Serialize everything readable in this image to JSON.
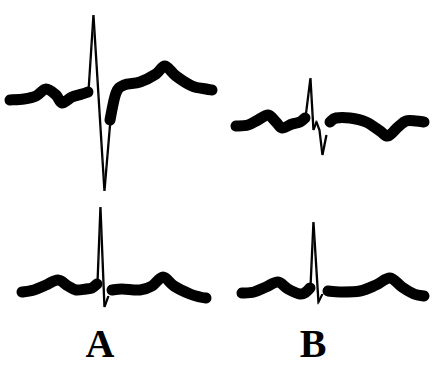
{
  "figure": {
    "width": 444,
    "height": 387,
    "background_color": "#ffffff",
    "ink_color": "#000000"
  },
  "labels": {
    "a": "A",
    "b": "B"
  },
  "chart_data": {
    "type": "line",
    "title": "",
    "xlabel": "",
    "ylabel": "",
    "grid": false,
    "legend": "none",
    "axis_visible": false,
    "stroke_color": "#000000",
    "panels": [
      {
        "id": "A-top",
        "label": "A",
        "row": "top",
        "column": "left",
        "baseline_y": 98,
        "x_range": [
          10,
          212
        ],
        "thick_stroke_width": 11,
        "thin_stroke_width": 1.4,
        "features": {
          "p_wave_peak": {
            "x": 46,
            "y": 88
          },
          "q_notch": {
            "x": 62,
            "y": 103
          },
          "r_peak": {
            "x": 93,
            "y": 15
          },
          "s_trough": {
            "x": 104,
            "y": 191
          },
          "st_segment_y": 82,
          "t_wave_peak": {
            "x": 165,
            "y": 66
          }
        },
        "points": [
          [
            10,
            100
          ],
          [
            24,
            99
          ],
          [
            36,
            96
          ],
          [
            46,
            89
          ],
          [
            56,
            95
          ],
          [
            62,
            103
          ],
          [
            72,
            97
          ],
          [
            82,
            94
          ],
          [
            88,
            92
          ],
          [
            93,
            15
          ],
          [
            104,
            191
          ],
          [
            110,
            120
          ],
          [
            116,
            93
          ],
          [
            124,
            85
          ],
          [
            140,
            82
          ],
          [
            156,
            74
          ],
          [
            165,
            66
          ],
          [
            176,
            76
          ],
          [
            192,
            86
          ],
          [
            206,
            89
          ],
          [
            212,
            90
          ]
        ]
      },
      {
        "id": "A-bottom",
        "label": "A",
        "row": "bottom",
        "column": "left",
        "baseline_y": 287,
        "x_range": [
          22,
          206
        ],
        "thick_stroke_width": 11,
        "thin_stroke_width": 1.4,
        "features": {
          "p_wave_peak": {
            "x": 58,
            "y": 279
          },
          "q_notch": {
            "x": 76,
            "y": 290
          },
          "r_peak": {
            "x": 100,
            "y": 207
          },
          "s_trough": {
            "x": 104,
            "y": 307
          },
          "st_segment_y": 288,
          "t_wave_peak": {
            "x": 163,
            "y": 277
          }
        },
        "points": [
          [
            22,
            292
          ],
          [
            34,
            290
          ],
          [
            46,
            285
          ],
          [
            58,
            280
          ],
          [
            68,
            286
          ],
          [
            76,
            290
          ],
          [
            86,
            289
          ],
          [
            92,
            288
          ],
          [
            97,
            284
          ],
          [
            100,
            207
          ],
          [
            104,
            307
          ],
          [
            108,
            296
          ],
          [
            112,
            290
          ],
          [
            122,
            289
          ],
          [
            140,
            290
          ],
          [
            152,
            286
          ],
          [
            163,
            277
          ],
          [
            174,
            286
          ],
          [
            190,
            294
          ],
          [
            200,
            297
          ],
          [
            206,
            298
          ]
        ]
      },
      {
        "id": "B-top",
        "label": "B",
        "row": "top",
        "column": "right",
        "baseline_y": 122,
        "x_range": [
          236,
          424
        ],
        "thick_stroke_width": 11,
        "thin_stroke_width": 1.4,
        "features": {
          "p_wave_peak": {
            "x": 268,
            "y": 114
          },
          "q_notch": {
            "x": 282,
            "y": 128
          },
          "r_peak": {
            "x": 310,
            "y": 78
          },
          "r_prime_notch": {
            "x": 314,
            "y": 132
          },
          "s_trough": {
            "x": 322,
            "y": 155
          },
          "st_segment_y": 118,
          "t_wave_trough": {
            "x": 388,
            "y": 136
          },
          "t_wave_peak": {
            "x": 404,
            "y": 122
          }
        },
        "points": [
          [
            236,
            126
          ],
          [
            248,
            125
          ],
          [
            258,
            120
          ],
          [
            268,
            115
          ],
          [
            276,
            122
          ],
          [
            282,
            128
          ],
          [
            292,
            124
          ],
          [
            300,
            122
          ],
          [
            305,
            118
          ],
          [
            310,
            78
          ],
          [
            313,
            130
          ],
          [
            316,
            122
          ],
          [
            319,
            130
          ],
          [
            322,
            155
          ],
          [
            326,
            135
          ],
          [
            330,
            122
          ],
          [
            336,
            118
          ],
          [
            350,
            118
          ],
          [
            366,
            122
          ],
          [
            380,
            131
          ],
          [
            388,
            136
          ],
          [
            398,
            127
          ],
          [
            406,
            121
          ],
          [
            416,
            121
          ],
          [
            424,
            122
          ]
        ]
      },
      {
        "id": "B-bottom",
        "label": "B",
        "row": "bottom",
        "column": "right",
        "baseline_y": 290,
        "x_range": [
          242,
          424
        ],
        "thick_stroke_width": 11,
        "thin_stroke_width": 1.4,
        "features": {
          "p_wave_peak": {
            "x": 278,
            "y": 281
          },
          "q_notch": {
            "x": 300,
            "y": 294
          },
          "r_peak": {
            "x": 313,
            "y": 222
          },
          "s_trough": {
            "x": 318,
            "y": 302
          },
          "st_segment_y": 290,
          "t_wave_peak": {
            "x": 390,
            "y": 278
          }
        },
        "points": [
          [
            242,
            293
          ],
          [
            254,
            292
          ],
          [
            266,
            287
          ],
          [
            278,
            282
          ],
          [
            288,
            289
          ],
          [
            300,
            294
          ],
          [
            306,
            292
          ],
          [
            310,
            288
          ],
          [
            313,
            222
          ],
          [
            318,
            302
          ],
          [
            322,
            294
          ],
          [
            328,
            291
          ],
          [
            340,
            292
          ],
          [
            360,
            291
          ],
          [
            376,
            285
          ],
          [
            390,
            278
          ],
          [
            402,
            287
          ],
          [
            414,
            294
          ],
          [
            424,
            296
          ]
        ]
      }
    ]
  }
}
